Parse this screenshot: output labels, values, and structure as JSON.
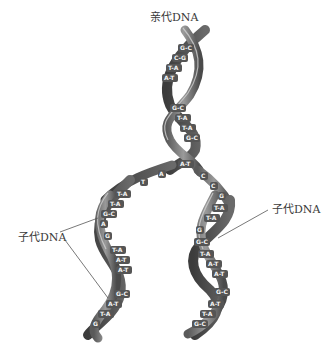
{
  "labels": {
    "parent": "亲代DNA",
    "daughter_left": "子代DNA",
    "daughter_right": "子代DNA"
  },
  "base_pairs": {
    "parent": [
      "G-C",
      "C-G",
      "T-A",
      "A-T",
      "G-C",
      "T-A",
      "T-A",
      "G-C"
    ],
    "fork": [
      "A-T",
      "A",
      "T",
      "C",
      "C",
      "G"
    ],
    "daughter_left": [
      "T-A",
      "T-A",
      "G-C",
      "A",
      "G",
      "T-A",
      "A-T",
      "A-T",
      "G-C",
      "A-T",
      "T-A",
      "G"
    ],
    "daughter_right": [
      "T-A",
      "T-A",
      "G",
      "G-C",
      "T-A",
      "A-T",
      "A-T",
      "G-C",
      "A-T",
      "T-A",
      "G-C"
    ]
  },
  "colors": {
    "background": "#ffffff",
    "strand_dark": "#4a4a4a",
    "strand_mid": "#7a7a7a",
    "strand_light": "#b5b5b5",
    "base_box": "#5a5a5a",
    "leader_line": "#555555",
    "label_text": "#3a3a3a"
  }
}
